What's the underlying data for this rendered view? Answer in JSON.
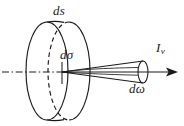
{
  "figure": {
    "background_color": "#ffffff",
    "stroke_color": "#1a1a1a",
    "labels": {
      "surface_element": "ds",
      "cross_section": "dσ",
      "solid_angle": "dω",
      "intensity_symbol": "I",
      "intensity_subscript": "ν"
    },
    "geometry": {
      "axis": {
        "style": "dash-dot",
        "y": 72,
        "x_start": 2,
        "x_end": 180,
        "arrowhead": "right"
      },
      "front_disc_ellipse": {
        "cx": 47,
        "cy": 71,
        "rx": 21,
        "ry": 49,
        "style": "solid"
      },
      "back_disc_ellipse": {
        "cx": 69,
        "cy": 71,
        "rx": 21,
        "ry": 49,
        "style": "solid-right-half-dashed-left-half"
      },
      "cone": {
        "apex_x": 62,
        "apex_y": 72,
        "end_cx": 143,
        "end_cy": 72,
        "end_rx": 5,
        "end_ry": 11
      }
    }
  }
}
